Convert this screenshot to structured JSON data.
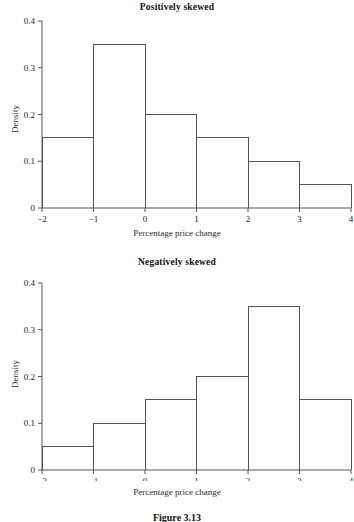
{
  "figure": {
    "caption": "Figure 3.13"
  },
  "panels": [
    {
      "id": "positive",
      "title": "Positively skewed",
      "xlabel": "Percentage price change",
      "ylabel": "Density",
      "xticks": [
        "−2",
        "−1",
        "0",
        "1",
        "2",
        "3",
        "4"
      ],
      "yticks": [
        "0",
        "0.1",
        "0.2",
        "0.3",
        "0.4"
      ]
    },
    {
      "id": "negative",
      "title": "Negatively skewed",
      "xlabel": "Percentage price change",
      "ylabel": "Density",
      "xticks": [
        "−2",
        "−1",
        "0",
        "1",
        "2",
        "3",
        "4"
      ],
      "yticks": [
        "0",
        "0.1",
        "0.2",
        "0.3",
        "0.4"
      ]
    }
  ],
  "chart_data": [
    {
      "type": "bar",
      "title": "Positively skewed",
      "xlabel": "Percentage price change",
      "ylabel": "Density",
      "xlim": [
        -2,
        4
      ],
      "ylim": [
        0,
        0.4
      ],
      "grid": false,
      "legend": null,
      "bin_edges": [
        -2,
        -1,
        0,
        1,
        2,
        3,
        4
      ],
      "categories": [
        "-2 to -1",
        "-1 to 0",
        "0 to 1",
        "1 to 2",
        "2 to 3",
        "3 to 4"
      ],
      "values": [
        0.15,
        0.35,
        0.2,
        0.15,
        0.1,
        0.05
      ],
      "xticks": [
        -2,
        -1,
        0,
        1,
        2,
        3,
        4
      ],
      "yticks": [
        0,
        0.1,
        0.2,
        0.3,
        0.4
      ]
    },
    {
      "type": "bar",
      "title": "Negatively skewed",
      "xlabel": "Percentage price change",
      "ylabel": "Density",
      "xlim": [
        -2,
        4
      ],
      "ylim": [
        0,
        0.4
      ],
      "grid": false,
      "legend": null,
      "bin_edges": [
        -2,
        -1,
        0,
        1,
        2,
        3,
        4
      ],
      "categories": [
        "-2 to -1",
        "-1 to 0",
        "0 to 1",
        "1 to 2",
        "2 to 3",
        "3 to 4"
      ],
      "values": [
        0.05,
        0.1,
        0.15,
        0.2,
        0.35,
        0.15
      ],
      "xticks": [
        -2,
        -1,
        0,
        1,
        2,
        3,
        4
      ],
      "yticks": [
        0,
        0.1,
        0.2,
        0.3,
        0.4
      ]
    }
  ],
  "style": {
    "line_color": "#555555",
    "text_color": "#1a1a1a",
    "background": "#ffffff"
  }
}
